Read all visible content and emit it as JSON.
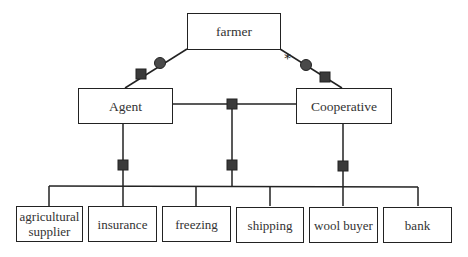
{
  "diagram": {
    "root": {
      "label": "farmer"
    },
    "intermediaries": [
      {
        "label": "Agent"
      },
      {
        "label": "Cooperative"
      }
    ],
    "services": [
      {
        "label": "agricultural supplier"
      },
      {
        "label": "insurance"
      },
      {
        "label": "freezing"
      },
      {
        "label": "shipping"
      },
      {
        "label": "wool buyer"
      },
      {
        "label": "bank"
      }
    ],
    "markers": {
      "multiplicity_symbol": "*",
      "connector_square_color": "#3a3a3a",
      "connector_circle_color": "#4a4a4a"
    }
  }
}
